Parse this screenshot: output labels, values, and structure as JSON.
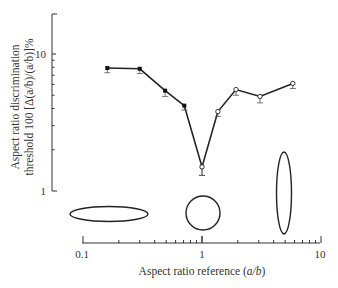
{
  "chart_data": {
    "type": "line",
    "title": "",
    "xlabel": "Aspect ratio reference (a/b)",
    "ylabel_line1": "Aspect ratio discrimination",
    "ylabel_line2": "threshold 100 [Δ(a/b)/(a/b)]%",
    "xscale": "log",
    "yscale": "log",
    "xlim": [
      0.1,
      10
    ],
    "ylim": [
      1,
      20
    ],
    "xticks": [
      "0.1",
      "1",
      "10"
    ],
    "yticks": [
      "1",
      "10"
    ],
    "grid": false,
    "series": [
      {
        "name": "filled markers (a/b < 1)",
        "marker": "filled-square",
        "x": [
          0.16,
          0.3,
          0.49,
          0.71,
          1.0
        ],
        "y": [
          7.9,
          7.8,
          5.4,
          4.2,
          1.5
        ],
        "err": [
          0.6,
          0.6,
          0.5,
          0.3,
          0.2
        ]
      },
      {
        "name": "open markers (a/b > 1)",
        "marker": "open-circle",
        "x": [
          1.0,
          1.36,
          1.93,
          3.07,
          5.8
        ],
        "y": [
          1.5,
          3.8,
          5.5,
          4.9,
          6.1
        ],
        "err": [
          0.2,
          0.3,
          0.5,
          0.5,
          0.5
        ]
      }
    ],
    "annotations": [
      {
        "type": "ellipse",
        "description": "horizontal elongated ellipse",
        "near_x": 0.2
      },
      {
        "type": "circle",
        "description": "circle",
        "near_x": 1.0
      },
      {
        "type": "ellipse",
        "description": "vertical elongated ellipse",
        "near_x": 5.0
      }
    ]
  },
  "labels": {
    "x_0_1": "0.1",
    "x_1": "1",
    "x_10": "10",
    "y_1": "1",
    "y_10": "10",
    "xlabel_main": "Aspect ratio reference (",
    "xlabel_italic": "a/b",
    "xlabel_end": ")",
    "ylabel_line1": "Aspect ratio discrimination",
    "ylabel_line2": "threshold 100 [Δ(a/b)/(a/b)]%"
  }
}
